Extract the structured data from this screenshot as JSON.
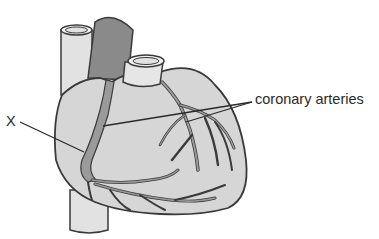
{
  "diagram": {
    "labels": {
      "x_marker": "X",
      "coronary": "coronary arteries"
    },
    "colors": {
      "heart_fill": "#d6d6d6",
      "vessel_light": "#e2e2e2",
      "vessel_dark": "#8a8a8a",
      "artery_fill": "#9a9a9a",
      "outline": "#3a3a3a",
      "leader_line": "#2a2a2a"
    }
  }
}
